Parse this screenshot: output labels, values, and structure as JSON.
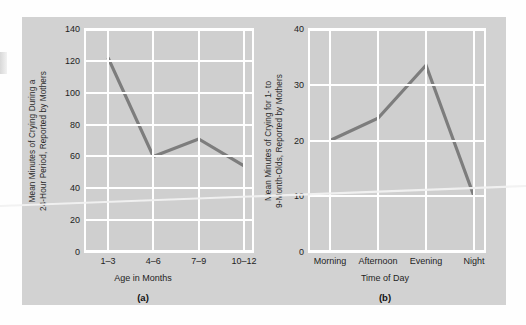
{
  "figure": {
    "background_color": "#d2d2d2",
    "line_color": "#7d7d7d",
    "grid_color": "#ffffff",
    "text_color": "#1e1e1e"
  },
  "chart_data": [
    {
      "type": "line",
      "panel_label": "(a)",
      "title": "",
      "categories": [
        "1–3",
        "4–6",
        "7–9",
        "10–12"
      ],
      "values": [
        122,
        60,
        71,
        54
      ],
      "xlabel": "Age in Months",
      "ylabel_lines": [
        "Mean Minutes of Crying During a",
        "24-Hour Period, Reported by Mothers"
      ],
      "ylabel": "Mean Minutes of Crying During a 24-Hour Period, Reported by Mothers",
      "yticks": [
        0,
        20,
        40,
        60,
        80,
        100,
        120,
        140
      ],
      "ylim": [
        0,
        140
      ],
      "grid": true,
      "legend": "none"
    },
    {
      "type": "line",
      "panel_label": "(b)",
      "title": "",
      "categories": [
        "Morning",
        "Afternoon",
        "Evening",
        "Night"
      ],
      "values": [
        20,
        24,
        33.5,
        10
      ],
      "xlabel": "Time of Day",
      "ylabel_lines": [
        "Mean Minutes of Crying for 1- to",
        "9-Month-Olds, Reported by Mothers"
      ],
      "ylabel": "Mean Minutes of Crying for 1- to 9-Month-Olds, Reported by Mothers",
      "yticks": [
        0,
        10,
        20,
        30,
        40
      ],
      "ylim": [
        0,
        40
      ],
      "grid": true,
      "legend": "none"
    }
  ]
}
